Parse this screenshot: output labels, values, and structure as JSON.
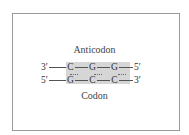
{
  "diagram": {
    "title_top": "Anticodon",
    "title_bottom": "Codon",
    "anticodon": {
      "left_end": "3′",
      "bases": [
        "C",
        "G",
        "G"
      ],
      "right_end": "5′"
    },
    "codon": {
      "left_end": "5′",
      "bases": [
        "G",
        "C",
        "C"
      ],
      "right_end": "3′"
    },
    "colors": {
      "shade": "#d6d6d6",
      "frame": "#9a9a9a",
      "text": "#333333"
    }
  }
}
